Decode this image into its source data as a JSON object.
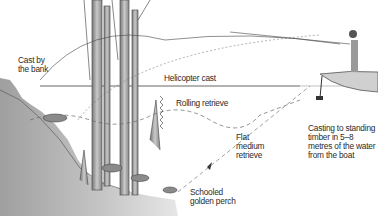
{
  "diagram": {
    "labels": {
      "cast_by_bank": "Cast by\nthe bank",
      "helicopter_cast": "Helicopter cast",
      "rolling_retrieve": "Rolling retrieve",
      "flat_medium_retrieve": "Flat\nmedium\nretrieve",
      "schooled_golden_perch": "Schooled\ngolden perch",
      "casting_to_timber": "Casting to standing\ntimber in 5–8\nmetres of the water\nfrom the boat"
    },
    "colors": {
      "ink": "#2a2a2a",
      "bank_shade": "#9a9a9a",
      "water_line": "#555555"
    }
  }
}
